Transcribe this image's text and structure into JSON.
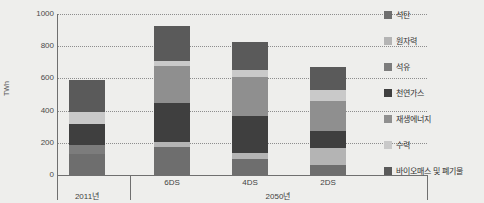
{
  "chart_data": {
    "type": "bar",
    "title": "",
    "xlabel": "",
    "ylabel": "TWh",
    "ylim": [
      0,
      1000
    ],
    "yticks": [
      0,
      200,
      400,
      600,
      800,
      1000
    ],
    "grid": true,
    "stacked": true,
    "legend_position": "right",
    "categories": [
      "2011년",
      "6DS",
      "4DS",
      "2DS"
    ],
    "group_labels": [
      {
        "label": "2011년",
        "categories": [
          "2011년"
        ]
      },
      {
        "label": "2050년",
        "categories": [
          "6DS",
          "4DS",
          "2DS"
        ]
      }
    ],
    "series": [
      {
        "name": "석탄",
        "color": "#6e6e6e",
        "values": [
          130,
          175,
          100,
          65
        ]
      },
      {
        "name": "원자력",
        "color": "#b4b4b4",
        "values": [
          0,
          30,
          35,
          100
        ]
      },
      {
        "name": "석유",
        "color": "#7c7c7c",
        "values": [
          55,
          0,
          0,
          0
        ]
      },
      {
        "name": "천연가스",
        "color": "#3f3f3f",
        "values": [
          130,
          240,
          230,
          110
        ]
      },
      {
        "name": "재생에너지",
        "color": "#8f8f8f",
        "values": [
          0,
          230,
          245,
          185
        ]
      },
      {
        "name": "수력",
        "color": "#c9c9c9",
        "values": [
          75,
          35,
          45,
          65
        ]
      },
      {
        "name": "바이오매스 및 폐기물",
        "color": "#5a5a5a",
        "values": [
          200,
          215,
          170,
          145
        ]
      }
    ],
    "totals": [
      590,
      925,
      825,
      670
    ]
  },
  "legend": {
    "items": [
      {
        "label": "석탄",
        "color": "#6e6e6e",
        "swatch_name": "legend-swatch-coal"
      },
      {
        "label": "원자력",
        "color": "#b4b4b4",
        "swatch_name": "legend-swatch-nuclear"
      },
      {
        "label": "석유",
        "color": "#7c7c7c",
        "swatch_name": "legend-swatch-oil"
      },
      {
        "label": "천연가스",
        "color": "#3f3f3f",
        "swatch_name": "legend-swatch-natural-gas"
      },
      {
        "label": "재생에너지",
        "color": "#8f8f8f",
        "swatch_name": "legend-swatch-renewable"
      },
      {
        "label": "수력",
        "color": "#c9c9c9",
        "swatch_name": "legend-swatch-hydro"
      },
      {
        "label": "바이오매스 및 폐기물",
        "color": "#5a5a5a",
        "swatch_name": "legend-swatch-biomass-waste"
      }
    ]
  },
  "axis": {
    "y_unit_label": "TWh",
    "tick_labels": [
      "1000",
      "800",
      "600",
      "400",
      "200",
      "0"
    ]
  },
  "colors": {
    "background": "#eeeeec",
    "axis": "#6f6f6f",
    "gridline": "#8d8d8d",
    "text": "#3b3b3b"
  }
}
